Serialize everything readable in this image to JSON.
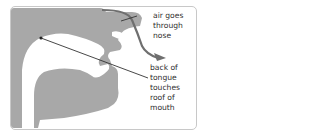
{
  "diagram": {
    "labels": {
      "air": [
        "air goes",
        "through",
        "nose"
      ],
      "tongue": [
        "back of",
        "tongue",
        "touches",
        "roof of",
        "mouth"
      ]
    },
    "colors": {
      "head": "#a8a8a8",
      "arrow": "#6f6f6f",
      "pointer_line": "#333333",
      "text": "#2f2f2f",
      "border": "#c8c8c8"
    }
  }
}
